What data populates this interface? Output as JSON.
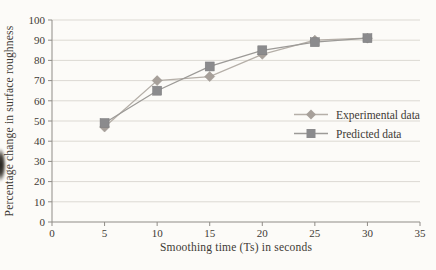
{
  "chart_data": {
    "type": "line",
    "title": "",
    "xlabel": "Smoothing time (Ts) in seconds",
    "ylabel": "Percentage change in surface roughness",
    "x": [
      5,
      10,
      15,
      20,
      25,
      30
    ],
    "series": [
      {
        "name": "Experimental data",
        "marker": "diamond",
        "color": "#a7a09a",
        "line_color": "#b5afa8",
        "values": [
          47,
          70,
          72,
          83,
          90,
          91
        ]
      },
      {
        "name": "Predicted data",
        "marker": "square",
        "color": "#8b8b8d",
        "line_color": "#9c9a97",
        "values": [
          49,
          65,
          77,
          85,
          89,
          91
        ]
      }
    ],
    "xlim": [
      0,
      35
    ],
    "ylim": [
      0,
      100
    ],
    "x_ticks": [
      0,
      5,
      10,
      15,
      20,
      25,
      30,
      35
    ],
    "y_ticks": [
      0,
      10,
      20,
      30,
      40,
      50,
      60,
      70,
      80,
      90,
      100
    ],
    "grid": "horizontal",
    "legend_position": "middle-right"
  },
  "styles": {
    "background": "#fcfbf8",
    "grid_color": "#dcd9d3",
    "axis_color": "#8f8c87",
    "text_color": "#3e3a35"
  }
}
